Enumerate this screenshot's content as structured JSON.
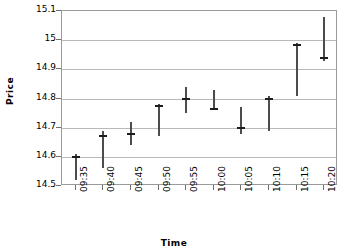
{
  "chart_data": {
    "type": "scatter",
    "title": "",
    "xlabel": "Time",
    "ylabel": "Price",
    "categories": [
      "09:35",
      "09:40",
      "09:45",
      "09:50",
      "09:55",
      "10:00",
      "10:05",
      "10:10",
      "10:15",
      "10:20"
    ],
    "ylim": [
      14.5,
      15.1
    ],
    "ytick_labels": [
      "15.1",
      "15",
      "14.9",
      "14.8",
      "14.7",
      "14.6",
      "14.5"
    ],
    "ytick_values": [
      15.1,
      15.0,
      14.9,
      14.8,
      14.7,
      14.6,
      14.5
    ],
    "grid": true,
    "legend": "none",
    "series": [
      {
        "name": "Price range",
        "points": [
          {
            "x": "09:35",
            "low": 14.52,
            "high": 14.61,
            "mark": 14.6
          },
          {
            "x": "09:40",
            "low": 14.56,
            "high": 14.69,
            "mark": 14.67
          },
          {
            "x": "09:45",
            "low": 14.64,
            "high": 14.72,
            "mark": 14.68
          },
          {
            "x": "09:50",
            "low": 14.67,
            "high": 14.78,
            "mark": 14.775
          },
          {
            "x": "09:55",
            "low": 14.75,
            "high": 14.84,
            "mark": 14.8
          },
          {
            "x": "10:00",
            "low": 14.76,
            "high": 14.83,
            "mark": 14.765
          },
          {
            "x": "10:05",
            "low": 14.68,
            "high": 14.77,
            "mark": 14.7
          },
          {
            "x": "10:10",
            "low": 14.69,
            "high": 14.81,
            "mark": 14.8
          },
          {
            "x": "10:15",
            "low": 14.81,
            "high": 14.99,
            "mark": 14.985
          },
          {
            "x": "10:20",
            "low": 14.93,
            "high": 15.08,
            "mark": 14.94
          }
        ]
      }
    ],
    "colors": {
      "bar": "#4c4c4c",
      "mark": "#1d1d1d",
      "grid": "#b9b9b9",
      "axis": "#9a9a9a",
      "text": "#000000",
      "background": "#ffffff"
    }
  }
}
